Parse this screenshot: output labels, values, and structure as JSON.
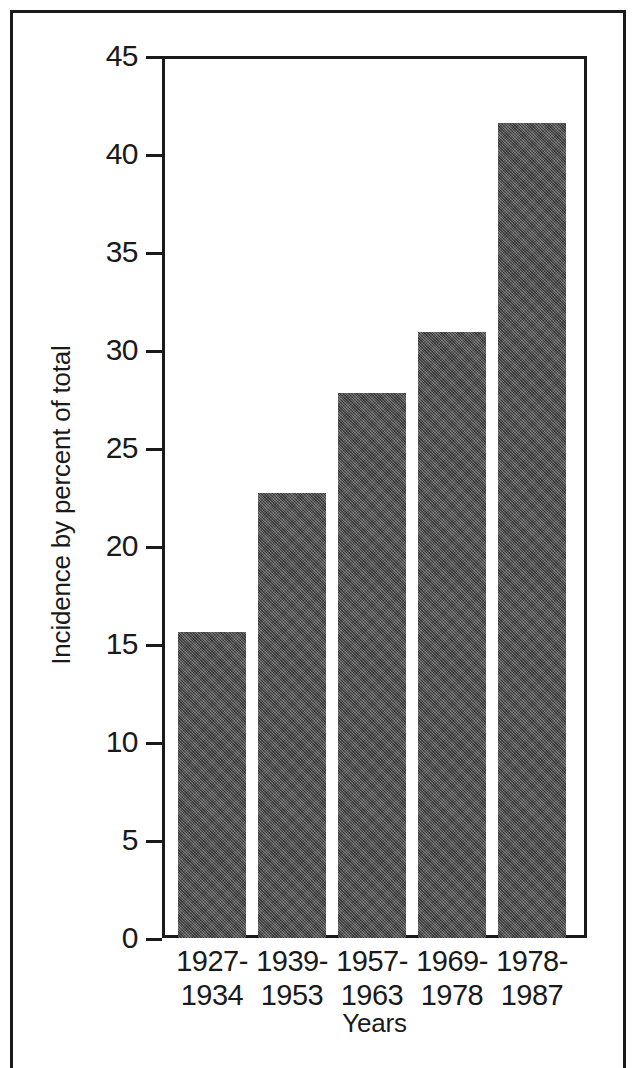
{
  "figure": {
    "frame_visible": true,
    "background_color": "#ffffff",
    "ink_color": "#1a1a1a"
  },
  "chart_data": {
    "type": "bar",
    "title": "",
    "subtitle": "",
    "xlabel": "Years",
    "ylabel": "Incidence by percent of total",
    "categories": [
      "1927-\n1934",
      "1939-\n1953",
      "1957-\n1963",
      "1969-\n1978",
      "1978-\n1987"
    ],
    "category_lines": [
      [
        "1927-",
        "1934"
      ],
      [
        "1939-",
        "1953"
      ],
      [
        "1957-",
        "1963"
      ],
      [
        "1969-",
        "1978"
      ],
      [
        "1978-",
        "1987"
      ]
    ],
    "values": [
      15.6,
      22.7,
      27.8,
      30.9,
      41.6
    ],
    "ylim": [
      0,
      45
    ],
    "xlim": null,
    "yticks": [
      0,
      5,
      10,
      15,
      20,
      25,
      30,
      35,
      40,
      45
    ],
    "ytick_labels": [
      "0",
      "5",
      "10",
      "15",
      "20",
      "25",
      "30",
      "35",
      "40",
      "45"
    ],
    "grid": false,
    "legend": null,
    "legend_position": "none",
    "bar_color": "#5a5a5a",
    "annotations": []
  }
}
